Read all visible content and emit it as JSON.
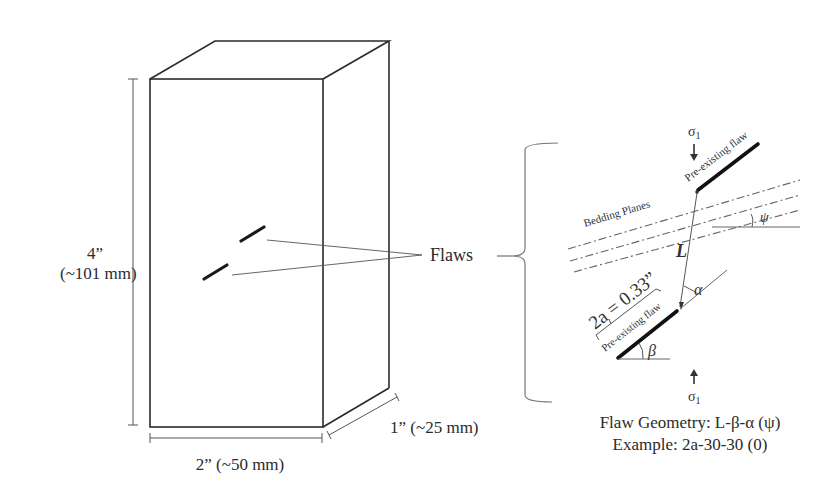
{
  "specimen": {
    "height_label_line1": "4”",
    "height_label_line2": "(~101 mm)",
    "width_label": "2” (~50 mm)",
    "depth_label": "1” (~25 mm)",
    "flaws_label": "Flaws"
  },
  "detail": {
    "sigma_top": "σ",
    "sigma_top_sub": "1",
    "sigma_bottom": "σ",
    "sigma_bottom_sub": "1",
    "upper_flaw_label": "Pre-existing flaw",
    "lower_flaw_label": "Pre-existing flaw",
    "bedding_label": "Bedding Planes",
    "ligament_label": "L",
    "alpha_label": "α",
    "beta_label": "β",
    "psi_label": "ψ",
    "flaw_length_label": "2a = 0.33”"
  },
  "caption": {
    "line1": "Flaw Geometry: L-β-α (ψ)",
    "line2": "Example: 2a-30-30 (0)"
  },
  "colors": {
    "line": "#2a2a2a",
    "thin_line": "#555555",
    "background": "#ffffff"
  }
}
